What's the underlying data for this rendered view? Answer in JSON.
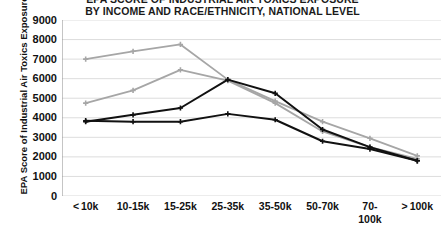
{
  "chart_data": {
    "type": "line",
    "title": "EPA SCORE OF INDUSTRIAL AIR TOXICS EXPOSURE BY INCOME AND RACE/ETHNICITY, NATIONAL LEVEL",
    "title_line1": "EPA SCORE OF INDUSTRIAL AIR TOXICS EXPOSURE",
    "title_line2": "BY INCOME AND RACE/ETHNICITY, NATIONAL LEVEL",
    "xlabel": "",
    "ylabel": "EPA Score of Industrial Air Toxics Exposure",
    "ylim": [
      0,
      9000
    ],
    "ytick_step": 1000,
    "yticks": [
      "9000",
      "8000",
      "7000",
      "6000",
      "5000",
      "4000",
      "3000",
      "2000",
      "1000",
      "0"
    ],
    "grid": true,
    "legend": false,
    "legend_position": "none",
    "categories": [
      "< 10k",
      "10-15k",
      "15-25k",
      "25-35k",
      "35-50k",
      "50-70k",
      "70-100k",
      "> 100k"
    ],
    "category_lines": [
      [
        "< 10k",
        ""
      ],
      [
        "10-15k",
        ""
      ],
      [
        "15-25k",
        ""
      ],
      [
        "25-35k",
        ""
      ],
      [
        "35-50k",
        ""
      ],
      [
        "50-70k",
        ""
      ],
      [
        "70-",
        "100k"
      ],
      [
        "> 100k",
        ""
      ]
    ],
    "series": [
      {
        "name": "series-1",
        "color": "#a6a6a6",
        "values": [
          7000,
          7400,
          7750,
          5950,
          4850,
          3800,
          2950,
          2050
        ]
      },
      {
        "name": "series-2",
        "color": "#a6a6a6",
        "values": [
          4750,
          5400,
          6450,
          5900,
          4750,
          3300,
          2500,
          1900
        ]
      },
      {
        "name": "series-3",
        "color": "#111111",
        "values": [
          3800,
          4150,
          4500,
          5950,
          5250,
          3400,
          2500,
          1800
        ]
      },
      {
        "name": "series-4",
        "color": "#111111",
        "values": [
          3850,
          3800,
          3800,
          4200,
          3900,
          2800,
          2400,
          1800
        ]
      }
    ]
  },
  "colors": {
    "gridline": "#d9d9d9",
    "axis": "#8c8c8c",
    "text": "#111111",
    "background": "#ffffff",
    "gray_series": "#a6a6a6",
    "black_series": "#111111"
  }
}
